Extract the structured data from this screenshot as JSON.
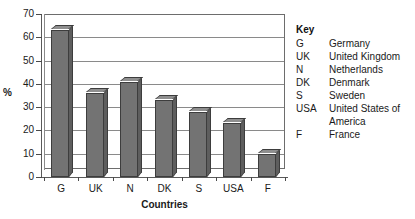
{
  "chart_data": {
    "type": "bar",
    "title": "",
    "xlabel": "Countries",
    "ylabel": "%",
    "categories": [
      "G",
      "UK",
      "N",
      "DK",
      "S",
      "USA",
      "F"
    ],
    "values": [
      63,
      36,
      41,
      33,
      28,
      23,
      10
    ],
    "ylim": [
      0,
      70
    ],
    "ytick_step": 10,
    "yticks": [
      70,
      60,
      50,
      40,
      30,
      20,
      10,
      0
    ],
    "grid": true,
    "legend_position": "right",
    "bar_style": "3d",
    "series": [
      {
        "name": "Percentage",
        "values": [
          63,
          36,
          41,
          33,
          28,
          23,
          10
        ]
      }
    ]
  },
  "axes": {
    "y_title": "%",
    "x_title": "Countries"
  },
  "legend": {
    "title": "Key",
    "entries": [
      {
        "code": "G",
        "name": "Germany"
      },
      {
        "code": "UK",
        "name": "United Kingdom"
      },
      {
        "code": "N",
        "name": "Netherlands"
      },
      {
        "code": "DK",
        "name": "Denmark"
      },
      {
        "code": "S",
        "name": "Sweden"
      },
      {
        "code": "USA",
        "name": "United States of",
        "name_continuation": "America"
      },
      {
        "code": "F",
        "name": "France"
      }
    ]
  },
  "colors": {
    "bar_front": "#737373",
    "bar_top": "#8f8f8f",
    "bar_side": "#5e5e5e",
    "bar_outline": "#3d3d3d",
    "gridline": "#8a8a8a",
    "axis": "#5a5a5a",
    "text": "#1a1a1a",
    "background": "#ffffff"
  }
}
